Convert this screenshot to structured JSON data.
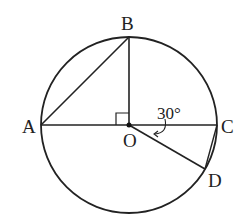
{
  "diagram": {
    "type": "circle-geometry",
    "circle": {
      "center": "O",
      "cx": 129,
      "cy": 125,
      "r": 88
    },
    "points": {
      "A": {
        "label": "A",
        "x": 41,
        "y": 125
      },
      "B": {
        "label": "B",
        "x": 129,
        "y": 37
      },
      "C": {
        "label": "C",
        "x": 217,
        "y": 125
      },
      "D": {
        "label": "D",
        "x": 205,
        "y": 169
      },
      "O": {
        "label": "O",
        "x": 129,
        "y": 125
      }
    },
    "segments": [
      "AB",
      "OB",
      "AC",
      "OD",
      "CD"
    ],
    "right_angle_at": "O (between OA and OB)",
    "angle": {
      "label": "30°",
      "between": "OC and OD"
    }
  }
}
